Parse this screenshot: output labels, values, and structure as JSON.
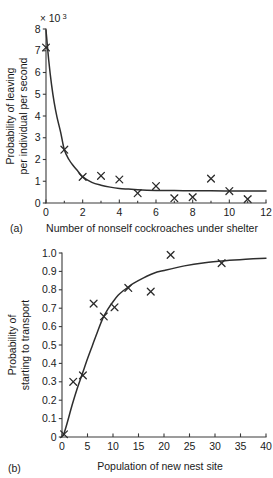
{
  "figure": {
    "panels": [
      {
        "id": "a",
        "panel_label": "(a)",
        "multiplier_times": "×",
        "multiplier_base": "10",
        "multiplier_exponent": "3"
      },
      {
        "id": "b",
        "panel_label": "(b)"
      }
    ]
  },
  "chart_data": [
    {
      "type": "scatter",
      "panel": "(a)",
      "title": "",
      "xlabel": "Number of nonself cockroaches under shelter",
      "ylabel": "Probability of leaving\nper individual per second",
      "ylabel_line1": "Probability of leaving",
      "ylabel_line2": "per individual per second",
      "y_multiplier": "× 10 3",
      "y_multiplier_note": "values are in units of 10^-3",
      "xlim": [
        0,
        12
      ],
      "ylim": [
        0,
        8
      ],
      "xticks": [
        0,
        2,
        4,
        6,
        8,
        10,
        12
      ],
      "xticklabels": [
        "0",
        "2",
        "4",
        "6",
        "8",
        "10",
        "12"
      ],
      "yticks": [
        0,
        1,
        2,
        3,
        4,
        5,
        6,
        7,
        8
      ],
      "yticklabels": [
        "0",
        "1",
        "2",
        "3",
        "4",
        "5",
        "6",
        "7",
        "8"
      ],
      "minor_xticks": [
        1,
        3,
        5,
        7,
        9,
        11
      ],
      "grid": false,
      "legend": false,
      "marker": "x",
      "points": [
        {
          "x": 0.0,
          "y": 7.15
        },
        {
          "x": 1.0,
          "y": 2.45
        },
        {
          "x": 2.0,
          "y": 1.2
        },
        {
          "x": 3.0,
          "y": 1.25
        },
        {
          "x": 4.0,
          "y": 1.08
        },
        {
          "x": 5.0,
          "y": 0.45
        },
        {
          "x": 6.0,
          "y": 0.78
        },
        {
          "x": 7.0,
          "y": 0.22
        },
        {
          "x": 8.0,
          "y": 0.27
        },
        {
          "x": 9.0,
          "y": 1.12
        },
        {
          "x": 10.0,
          "y": 0.55
        },
        {
          "x": 11.0,
          "y": 0.18
        }
      ],
      "fit_curve": {
        "description": "decaying exponential fit approaching asymptote ~0.55",
        "x": [
          0.0,
          0.15,
          0.3,
          0.45,
          0.6,
          0.8,
          1.0,
          1.25,
          1.5,
          1.75,
          2.0,
          2.5,
          3.0,
          3.5,
          4.0,
          4.5,
          5.0,
          6.0,
          7.0,
          8.0,
          9.0,
          10.0,
          11.0,
          12.0
        ],
        "y": [
          7.95,
          6.55,
          5.45,
          4.6,
          3.95,
          3.25,
          2.45,
          2.0,
          1.7,
          1.45,
          1.2,
          0.95,
          0.82,
          0.73,
          0.67,
          0.64,
          0.61,
          0.58,
          0.57,
          0.56,
          0.56,
          0.555,
          0.55,
          0.55
        ]
      }
    },
    {
      "type": "scatter",
      "panel": "(b)",
      "title": "",
      "xlabel": "Population of new nest site",
      "ylabel": "Probability of\nstarting to transport",
      "ylabel_line1": "Probability of",
      "ylabel_line2": "starting to transport",
      "xlim": [
        0,
        40
      ],
      "ylim": [
        0,
        1.0
      ],
      "xticks": [
        0,
        5,
        10,
        15,
        20,
        25,
        30,
        35,
        40
      ],
      "xticklabels": [
        "0",
        "5",
        "10",
        "15",
        "20",
        "25",
        "30",
        "35",
        "40"
      ],
      "yticks": [
        0,
        0.1,
        0.2,
        0.3,
        0.4,
        0.5,
        0.6,
        0.7,
        0.8,
        0.9,
        1.0
      ],
      "yticklabels": [
        "0",
        "0.1",
        "0.2",
        "0.3",
        "0.4",
        "0.5",
        "0.6",
        "0.7",
        "0.8",
        "0.9",
        "1.0"
      ],
      "grid": false,
      "legend": false,
      "marker": "x",
      "points": [
        {
          "x": 0.4,
          "y": 0.015
        },
        {
          "x": 2.2,
          "y": 0.3
        },
        {
          "x": 4.1,
          "y": 0.335
        },
        {
          "x": 6.2,
          "y": 0.725
        },
        {
          "x": 8.2,
          "y": 0.655
        },
        {
          "x": 10.3,
          "y": 0.705
        },
        {
          "x": 13.0,
          "y": 0.81
        },
        {
          "x": 17.4,
          "y": 0.79
        },
        {
          "x": 21.3,
          "y": 0.99
        },
        {
          "x": 31.3,
          "y": 0.945
        }
      ],
      "fit_curve": {
        "description": "saturating sigmoid/exponential approach to ~1.0",
        "x": [
          0.3,
          1.0,
          2.0,
          3.0,
          4.0,
          5.0,
          6.0,
          7.0,
          8.0,
          9.0,
          10.0,
          11.0,
          12.0,
          13.0,
          14.0,
          16.0,
          18.0,
          20.0,
          24.0,
          28.0,
          32.0,
          36.0,
          40.0
        ],
        "y": [
          0.01,
          0.075,
          0.175,
          0.265,
          0.345,
          0.425,
          0.5,
          0.575,
          0.645,
          0.695,
          0.735,
          0.77,
          0.795,
          0.815,
          0.835,
          0.865,
          0.89,
          0.905,
          0.93,
          0.947,
          0.958,
          0.966,
          0.972
        ]
      }
    }
  ]
}
